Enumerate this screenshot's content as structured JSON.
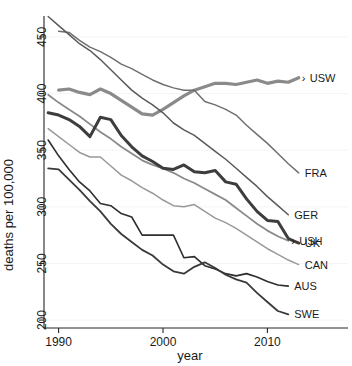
{
  "chart_data": {
    "type": "line",
    "title": "",
    "xlabel": "year",
    "ylabel": "deaths per 100,000",
    "xlim": [
      1988.6,
      2013.6
    ],
    "ylim": [
      193,
      472
    ],
    "xticks": [
      1990,
      2000,
      2010
    ],
    "xticklabels": [
      "1990",
      "2000",
      "2010"
    ],
    "yticks": [
      200,
      250,
      300,
      350,
      400,
      450
    ],
    "yticklabels": [
      "200",
      "250",
      "300",
      "350",
      "400",
      "450"
    ],
    "grid": "light-horizontal",
    "legend": "inline-right-end-labels",
    "x": [
      1989,
      1990,
      1991,
      1992,
      1993,
      1994,
      1995,
      1996,
      1997,
      1998,
      1999,
      2000,
      2001,
      2002,
      2003,
      2004,
      2005,
      2006,
      2007,
      2008,
      2009,
      2010,
      2011,
      2012,
      2013
    ],
    "series": [
      {
        "name": "USW",
        "label": "USW",
        "marker": "arrow",
        "color": "#8a8a8a",
        "width": 3.2,
        "values": [
          null,
          403,
          404,
          401,
          399,
          404,
          400,
          394,
          388,
          382,
          381,
          386,
          392,
          398,
          403,
          406,
          409,
          409,
          408,
          410,
          412,
          409,
          411,
          410,
          414
        ]
      },
      {
        "name": "FRA",
        "label": "FRA",
        "marker": "none",
        "color": "#6f6f6f",
        "width": 1.5,
        "values": [
          null,
          455,
          454,
          447,
          441,
          437,
          432,
          426,
          422,
          417,
          412,
          408,
          405,
          403,
          403,
          393,
          390,
          386,
          381,
          372,
          364,
          356,
          347,
          338,
          330
        ]
      },
      {
        "name": "GER",
        "label": "GER",
        "marker": "none",
        "color": "#5a5a5a",
        "width": 1.5,
        "values": [
          468,
          460,
          452,
          444,
          438,
          430,
          421,
          412,
          403,
          396,
          390,
          383,
          374,
          368,
          363,
          356,
          349,
          342,
          334,
          326,
          318,
          309,
          301,
          293,
          null
        ]
      },
      {
        "name": "USH",
        "label": "USH",
        "marker": "arrow",
        "color": "#8a8a8a",
        "width": 1.8,
        "values": [
          399,
          392,
          386,
          380,
          373,
          366,
          360,
          353,
          347,
          341,
          337,
          334,
          330,
          325,
          321,
          316,
          311,
          306,
          299,
          292,
          285,
          279,
          274,
          270,
          null
        ]
      },
      {
        "name": "UK",
        "label": "UK",
        "marker": "none",
        "color": "#3d3d3d",
        "width": 3.0,
        "values": [
          383,
          381,
          377,
          371,
          362,
          379,
          377,
          363,
          353,
          345,
          340,
          334,
          333,
          337,
          331,
          330,
          332,
          322,
          320,
          307,
          296,
          288,
          287,
          272,
          268
        ]
      },
      {
        "name": "CAN",
        "label": "CAN",
        "marker": "none",
        "color": "#999999",
        "width": 1.5,
        "values": [
          369,
          362,
          355,
          348,
          344,
          344,
          336,
          328,
          323,
          317,
          312,
          306,
          301,
          300,
          302,
          296,
          290,
          286,
          281,
          275,
          269,
          263,
          258,
          253,
          249
        ]
      },
      {
        "name": "AUS",
        "label": "AUS",
        "marker": "none",
        "color": "#2e2e2e",
        "width": 1.6,
        "values": [
          359,
          345,
          333,
          322,
          314,
          303,
          301,
          294,
          291,
          275,
          275,
          275,
          275,
          255,
          256,
          248,
          245,
          241,
          239,
          241,
          238,
          234,
          231,
          230,
          null
        ]
      },
      {
        "name": "SWE",
        "label": "SWE",
        "marker": "none",
        "color": "#3a3a3a",
        "width": 1.8,
        "values": [
          334,
          333,
          324,
          315,
          305,
          296,
          285,
          276,
          269,
          262,
          257,
          249,
          243,
          241,
          247,
          251,
          246,
          240,
          236,
          233,
          224,
          216,
          208,
          205,
          null
        ]
      }
    ]
  }
}
